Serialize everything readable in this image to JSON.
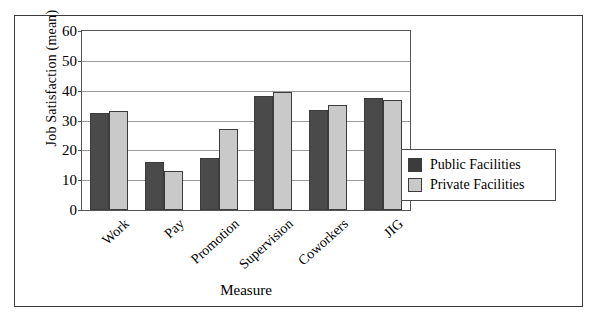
{
  "chart_data": {
    "type": "bar",
    "title": "",
    "xlabel": "Measure",
    "ylabel": "Job Satisfaction (mean)",
    "categories": [
      "Work",
      "Pay",
      "Promotion",
      "Supervision",
      "Coworkers",
      "JIG"
    ],
    "series": [
      {
        "name": "Public Facilities",
        "color": "#4a4a4a",
        "values": [
          32.5,
          16.0,
          17.5,
          38.3,
          33.5,
          37.5
        ]
      },
      {
        "name": "Private Facilities",
        "color": "#c9c9c9",
        "values": [
          33.3,
          13.0,
          27.3,
          39.5,
          35.3,
          36.8
        ]
      }
    ],
    "ylim": [
      0,
      60
    ],
    "yticks": [
      0,
      10,
      20,
      30,
      40,
      50,
      60
    ],
    "ytick_labels": [
      "0",
      "10",
      "20",
      "30",
      "40",
      "50",
      "60"
    ],
    "grid": "horizontal",
    "legend_position": "right"
  },
  "legend": {
    "entries": [
      {
        "label": "Public Facilities",
        "swatch": "public"
      },
      {
        "label": "Private Facilities",
        "swatch": "private"
      }
    ]
  }
}
